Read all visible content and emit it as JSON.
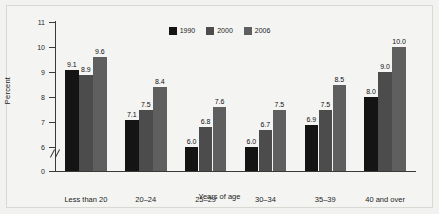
{
  "figure": {
    "background_color": "#f2f2f0",
    "frame_color": "#d8d8d4"
  },
  "chart_data": {
    "type": "bar",
    "title": "",
    "subtitle": "",
    "xlabel": "Years of age",
    "ylabel": "Percent",
    "categories": [
      "Less than 20",
      "20–24",
      "25–29",
      "30–34",
      "35–39",
      "40 and over"
    ],
    "series": [
      {
        "name": "1990",
        "color": "#141414",
        "values": [
          9.1,
          7.1,
          6.0,
          6.0,
          6.9,
          8.0
        ]
      },
      {
        "name": "2000",
        "color": "#4c4c4c",
        "values": [
          8.9,
          7.5,
          6.8,
          6.7,
          7.5,
          9.0
        ]
      },
      {
        "name": "2006",
        "color": "#5f5f5f",
        "values": [
          9.6,
          8.4,
          7.6,
          7.5,
          8.5,
          10.0
        ]
      }
    ],
    "value_labels": [
      [
        "9.1",
        "8.9",
        "9.6"
      ],
      [
        "7.1",
        "7.5",
        "8.4"
      ],
      [
        "6.0",
        "6.8",
        "7.6"
      ],
      [
        "6.0",
        "6.7",
        "7.5"
      ],
      [
        "6.9",
        "7.5",
        "8.5"
      ],
      [
        "8.0",
        "9.0",
        "10.0"
      ]
    ],
    "ylim": [
      0,
      11
    ],
    "axis_break": {
      "present": true,
      "between": [
        0,
        6
      ],
      "style": "double-slash"
    },
    "yticks": [
      0,
      6,
      7,
      8,
      9,
      10,
      11
    ],
    "ytick_labels": [
      "0",
      "6",
      "7",
      "8",
      "9",
      "10",
      "11"
    ],
    "grid": false,
    "legend_position": "top-center",
    "legend_entries": [
      "1990",
      "2000",
      "2006"
    ]
  }
}
